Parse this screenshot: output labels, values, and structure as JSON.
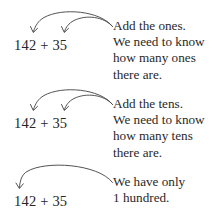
{
  "page": {
    "background": "#ffffff",
    "ink": "#282828",
    "arrow_color": "#4a4a4a"
  },
  "groups": [
    {
      "id": "ones",
      "expression": {
        "full": "142 + 35",
        "left_operand": "142",
        "operator": "+",
        "right_operand": "35"
      },
      "note_lines": [
        "Add the ones.",
        "We need to know",
        "how many ones",
        "there are."
      ],
      "arrow_count": 2,
      "arrow_targets": [
        "2",
        "5"
      ],
      "arrow_target_place": "ones"
    },
    {
      "id": "tens",
      "expression": {
        "full": "142 + 35",
        "left_operand": "142",
        "operator": "+",
        "right_operand": "35"
      },
      "note_lines": [
        "Add the tens.",
        "We need to know",
        "how many tens",
        "there are."
      ],
      "arrow_count": 2,
      "arrow_targets": [
        "4",
        "3"
      ],
      "arrow_target_place": "tens"
    },
    {
      "id": "hundreds",
      "expression": {
        "full": "142 + 35",
        "left_operand": "142",
        "operator": "+",
        "right_operand": "35"
      },
      "note_lines": [
        "We have only",
        "1 hundred."
      ],
      "arrow_count": 1,
      "arrow_targets": [
        "1"
      ],
      "arrow_target_place": "hundreds"
    }
  ]
}
